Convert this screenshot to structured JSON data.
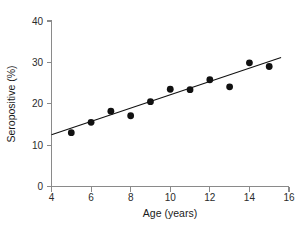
{
  "chart_data": {
    "type": "scatter",
    "title": "",
    "xlabel": "Age (years)",
    "ylabel": "Seropositive (%)",
    "xlim": [
      4,
      16
    ],
    "ylim": [
      0,
      40
    ],
    "xticks": [
      4,
      6,
      8,
      10,
      12,
      14,
      16
    ],
    "yticks": [
      0,
      10,
      20,
      30,
      40
    ],
    "xtick_labels": [
      "4",
      "6",
      "8",
      "10",
      "12",
      "14",
      "16"
    ],
    "ytick_labels": [
      "0",
      "10",
      "20",
      "30",
      "40"
    ],
    "grid": false,
    "legend": null,
    "x": [
      5,
      6,
      7,
      8,
      9,
      10,
      11,
      12,
      13,
      14,
      15
    ],
    "y": [
      13.0,
      15.5,
      18.2,
      17.1,
      20.5,
      23.5,
      23.4,
      25.8,
      24.1,
      29.9,
      29.0
    ],
    "series": [
      {
        "name": "Seropositive by age",
        "marker": "filled-circle",
        "color": "#111111",
        "points": [
          {
            "x": 5,
            "y": 13.0
          },
          {
            "x": 6,
            "y": 15.5
          },
          {
            "x": 7,
            "y": 18.2
          },
          {
            "x": 8,
            "y": 17.1
          },
          {
            "x": 9,
            "y": 20.5
          },
          {
            "x": 10,
            "y": 23.5
          },
          {
            "x": 11,
            "y": 23.4
          },
          {
            "x": 12,
            "y": 25.8
          },
          {
            "x": 13,
            "y": 24.1
          },
          {
            "x": 14,
            "y": 29.9
          },
          {
            "x": 15,
            "y": 29.0
          }
        ]
      }
    ],
    "trend_line": {
      "name": "regression-line",
      "color": "#111111",
      "x_start": 4.0,
      "y_start": 12.5,
      "x_end": 15.6,
      "y_end": 31.2
    },
    "colors": {
      "marker": "#111111",
      "line": "#111111",
      "axis": "#8a8a8a",
      "text": "#1a1a1a",
      "background": "#ffffff"
    }
  }
}
